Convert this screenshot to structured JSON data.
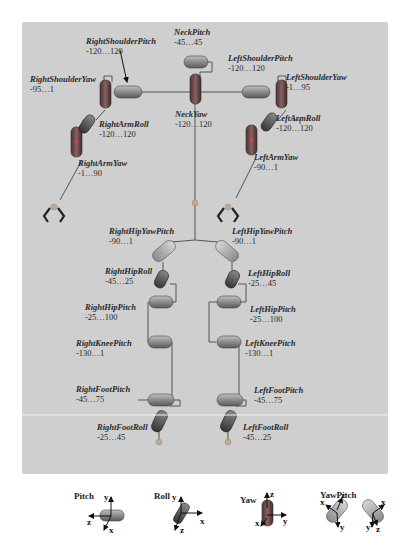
{
  "colors": {
    "panel_bg": "#cfcfcf",
    "pitch_cylinder": "#8e8e8e",
    "roll_cylinder": "#6e6e6e",
    "yaw_cylinder": "#7a4f4f",
    "yawpitch_cylinder": "#b4b4b4",
    "link_line": "#555555",
    "joint_dot": "#c9a88a"
  },
  "joints": {
    "neck_pitch": {
      "name": "NeckPitch",
      "range": "-45…45"
    },
    "neck_yaw": {
      "name": "NeckYaw",
      "range": "-120…120"
    },
    "right_shoulder_pitch": {
      "name": "RightShoulderPitch",
      "range": "-120…120"
    },
    "right_shoulder_yaw": {
      "name": "RightShoulderYaw",
      "range": "-95…1"
    },
    "right_arm_roll": {
      "name": "RightArmRoll",
      "range": "-120…120"
    },
    "right_arm_yaw": {
      "name": "RightArmYaw",
      "range": "-1…90"
    },
    "left_shoulder_pitch": {
      "name": "LeftShoulderPitch",
      "range": "-120…120"
    },
    "left_shoulder_yaw": {
      "name": "LeftShoulderYaw",
      "range": "-1…95"
    },
    "left_arm_roll": {
      "name": "LeftArmRoll",
      "range": "-120…120"
    },
    "left_arm_yaw": {
      "name": "LeftArmYaw",
      "range": "-90…1"
    },
    "right_hip_yaw_pitch": {
      "name": "RightHipYawPitch",
      "range": "-90…1"
    },
    "left_hip_yaw_pitch": {
      "name": "LeftHipYawPitch",
      "range": "-90…1"
    },
    "right_hip_roll": {
      "name": "RightHipRoll",
      "range": "-45…25"
    },
    "left_hip_roll": {
      "name": "LeftHipRoll",
      "range": "-25…45"
    },
    "right_hip_pitch": {
      "name": "RightHipPitch",
      "range": "-25…100"
    },
    "left_hip_pitch": {
      "name": "LeftHipPitch",
      "range": "-25…100"
    },
    "right_knee_pitch": {
      "name": "RightKneePitch",
      "range": "-130…1"
    },
    "left_knee_pitch": {
      "name": "LeftKneePitch",
      "range": "-130…1"
    },
    "right_foot_pitch": {
      "name": "RightFootPitch",
      "range": "-45…75"
    },
    "left_foot_pitch": {
      "name": "LeftFootPitch",
      "range": "-45…75"
    },
    "right_foot_roll": {
      "name": "RightFootRoll",
      "range": "-25…45"
    },
    "left_foot_roll": {
      "name": "LeftFootRoll",
      "range": "-45…25"
    }
  },
  "legend": {
    "pitch": {
      "label": "Pitch",
      "axes": [
        "y",
        "z",
        "x"
      ]
    },
    "roll": {
      "label": "Roll",
      "axes": [
        "y",
        "x",
        "z"
      ]
    },
    "yaw": {
      "label": "Yaw",
      "axes": [
        "z",
        "y",
        "x"
      ]
    },
    "yawpitch": {
      "label": "YawPitch",
      "axes": [
        "x",
        "z",
        "y",
        "x",
        "z",
        "y"
      ]
    }
  }
}
